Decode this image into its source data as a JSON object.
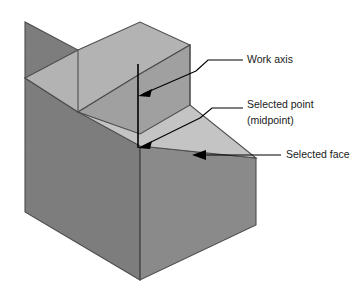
{
  "figure": {
    "background_color": "#ffffff"
  },
  "solid": {
    "name": "stepped-l-block",
    "faces": [
      {
        "id": "upper-top-face",
        "label": "Upper top face",
        "color": "#b3b3b3"
      },
      {
        "id": "upper-right-face",
        "label": "Upper right face",
        "color": "#a0a0a0"
      },
      {
        "id": "upper-left-face",
        "label": "Upper left face",
        "color": "#7d7d7d"
      },
      {
        "id": "step-top-face",
        "label": "Selected face (step top)",
        "color": "#c4c4c4"
      },
      {
        "id": "lower-right-face",
        "label": "Lower right face",
        "color": "#8a8a8a"
      },
      {
        "id": "lower-front-face",
        "label": "Lower front face",
        "color": "#7d7d7d"
      }
    ],
    "colors": {
      "top_light": "#b3b3b3",
      "selected_face": "#c4c4c4",
      "right_mid": "#a0a0a0",
      "right_dark": "#8a8a8a",
      "left_dark": "#7d7d7d",
      "outline": "#4d4d4d"
    }
  },
  "annotations": {
    "line_color": "#000000",
    "items": [
      {
        "id": "work-axis",
        "label": "Work axis",
        "label_lines": [
          "Work axis"
        ],
        "arrow": "points down-left to the vertical work axis line"
      },
      {
        "id": "selected-point",
        "label": "Selected point (midpoint)",
        "label_lines": [
          "Selected point",
          "(midpoint)"
        ],
        "arrow": "points down-left to the midpoint at the base of the work axis"
      },
      {
        "id": "selected-face",
        "label": "Selected face",
        "label_lines": [
          "Selected face"
        ],
        "arrow": "points left to the horizontal step top face"
      }
    ]
  },
  "work_axis": {
    "id": "work-axis-line",
    "description": "Vertical line from the upper top face down to the selected midpoint"
  }
}
